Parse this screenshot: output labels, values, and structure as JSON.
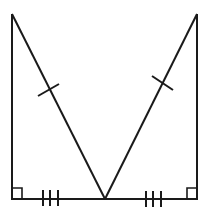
{
  "diagram": {
    "colors": {
      "background": "#ffffff",
      "stroke": "#1a1a1a"
    },
    "points": {
      "top_left": [
        12,
        14
      ],
      "top_right": [
        197,
        14
      ],
      "bottom_left": [
        12,
        199
      ],
      "bottom_right": [
        197,
        199
      ],
      "bottom_mid": [
        105,
        199
      ]
    },
    "segments": [
      {
        "name": "left-leg",
        "from": "top_left",
        "to": "bottom_left"
      },
      {
        "name": "right-leg",
        "from": "top_right",
        "to": "bottom_right"
      },
      {
        "name": "left-base",
        "from": "bottom_left",
        "to": "bottom_mid",
        "marks": 3
      },
      {
        "name": "right-base",
        "from": "bottom_mid",
        "to": "bottom_right",
        "marks": 3
      },
      {
        "name": "left-hypotenuse",
        "from": "top_left",
        "to": "bottom_mid",
        "marks": 1
      },
      {
        "name": "right-hypotenuse",
        "from": "top_right",
        "to": "bottom_mid",
        "marks": 1
      }
    ],
    "right_angles": [
      "bottom_left",
      "bottom_right"
    ]
  }
}
